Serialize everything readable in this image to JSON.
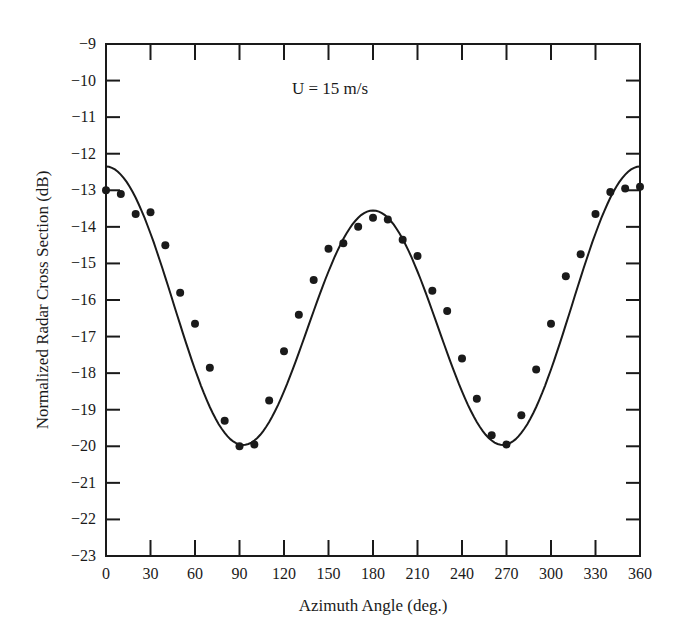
{
  "chart_data": {
    "type": "line",
    "title": "",
    "annotation": "U = 15 m/s",
    "xlabel": "Azimuth Angle (deg.)",
    "ylabel": "Normalized Radar Cross Section (dB)",
    "xlim": [
      0,
      360
    ],
    "ylim": [
      -23,
      -9
    ],
    "xticks": [
      0,
      30,
      60,
      90,
      120,
      150,
      180,
      210,
      240,
      270,
      300,
      330,
      360
    ],
    "yticks": [
      -9,
      -10,
      -11,
      -12,
      -13,
      -14,
      -15,
      -16,
      -17,
      -18,
      -19,
      -20,
      -21,
      -22,
      -23
    ],
    "grid": false,
    "legend": null,
    "series": [
      {
        "name": "Measured",
        "style": "markers",
        "x": [
          0,
          10,
          20,
          30,
          40,
          50,
          60,
          70,
          80,
          90,
          100,
          110,
          120,
          130,
          140,
          150,
          160,
          170,
          180,
          190,
          200,
          210,
          220,
          230,
          240,
          250,
          260,
          270,
          280,
          290,
          300,
          310,
          320,
          330,
          340,
          350,
          360
        ],
        "values": [
          -13.0,
          -13.1,
          -13.65,
          -13.6,
          -14.5,
          -15.8,
          -16.65,
          -17.85,
          -19.3,
          -20.0,
          -19.95,
          -18.75,
          -17.4,
          -16.4,
          -15.45,
          -14.6,
          -14.45,
          -14.0,
          -13.75,
          -13.8,
          -14.35,
          -14.8,
          -15.75,
          -16.3,
          -17.6,
          -18.7,
          -19.7,
          -19.95,
          -19.15,
          -17.9,
          -16.65,
          -15.35,
          -14.75,
          -13.65,
          -13.05,
          -12.95,
          -12.9
        ]
      },
      {
        "name": "Model fit",
        "style": "line",
        "model": "A0 + A1*cos(phi) + A2*cos(2*phi)",
        "coefficients": {
          "A0": -16.45,
          "A1": 0.6,
          "A2": 3.5
        }
      }
    ]
  }
}
